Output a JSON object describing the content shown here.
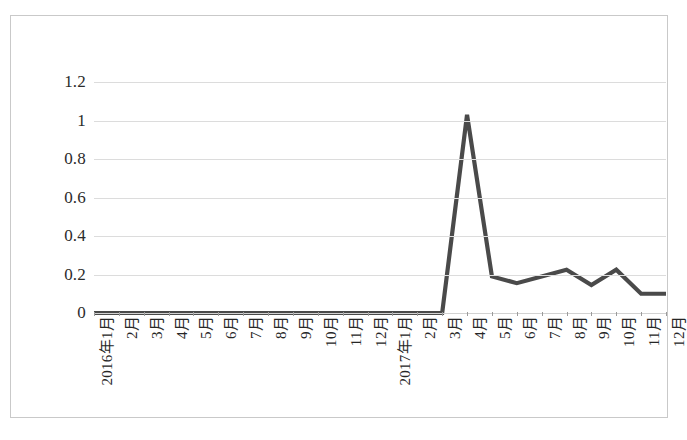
{
  "figure": {
    "background_color": "#ffffff",
    "frame_color": "#c9c9c9",
    "gridline_color": "#dcdcdc",
    "series_color": "#4a4a4a"
  },
  "chart_data": {
    "type": "line",
    "title": "",
    "subtitle": "",
    "xlabel": "",
    "ylabel": "",
    "grid": true,
    "legend": false,
    "legend_position": "none",
    "ylim": [
      0,
      1.2
    ],
    "ytick_labels": [
      "1.2",
      "1",
      "0.8",
      "0.6",
      "0.4",
      "0.2",
      "0"
    ],
    "yticks": [
      1.2,
      1,
      0.8,
      0.6,
      0.4,
      0.2,
      0
    ],
    "categories": [
      "2016年1月",
      "2月",
      "3月",
      "4月",
      "5月",
      "6月",
      "7月",
      "8月",
      "9月",
      "10月",
      "11月",
      "12月",
      "2017年1月",
      "2月",
      "3月",
      "4月",
      "5月",
      "6月",
      "7月",
      "8月",
      "9月",
      "10月",
      "11月",
      "12月"
    ],
    "values": [
      0,
      0,
      0,
      0,
      0,
      0,
      0,
      0,
      0,
      0,
      0,
      0,
      0,
      0,
      0,
      1.03,
      0.19,
      0.155,
      0.19,
      0.225,
      0.145,
      0.225,
      0.1,
      0.1
    ],
    "series": [
      {
        "name": "",
        "color": "#4a4a4a",
        "values": [
          0,
          0,
          0,
          0,
          0,
          0,
          0,
          0,
          0,
          0,
          0,
          0,
          0,
          0,
          0,
          1.03,
          0.19,
          0.155,
          0.19,
          0.225,
          0.145,
          0.225,
          0.1,
          0.1
        ]
      }
    ],
    "annotations": []
  }
}
